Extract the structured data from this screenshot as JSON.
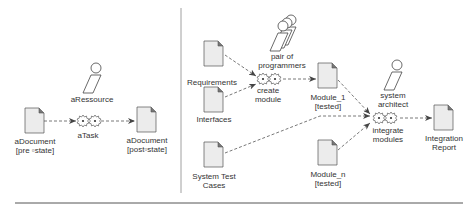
{
  "left_panel": {
    "pre_document": {
      "line1": "aDocument",
      "line2": "[pre ▫state]"
    },
    "task": {
      "label": "aTask"
    },
    "resource": {
      "label": "aRessource"
    },
    "post_document": {
      "line1": "aDocument",
      "line2": "[post▫state]"
    }
  },
  "right_panel": {
    "requirements": {
      "label": "Requirements"
    },
    "interfaces": {
      "label": "Interfaces"
    },
    "system_test_cases": {
      "line1": "System Test",
      "line2": "Cases"
    },
    "pair_of_programmers": {
      "line1": "pair of",
      "line2": "programmers"
    },
    "create_module": {
      "line1": "create",
      "line2": "module"
    },
    "module_1": {
      "line1": "Module_1",
      "line2": "[tested]"
    },
    "module_n": {
      "line1": "Module_n",
      "line2": "[tested]"
    },
    "system_architect": {
      "line1": "system",
      "line2": "architect"
    },
    "integrate_modules": {
      "line1": "integrate",
      "line2": "modules"
    },
    "integration_report": {
      "line1": "Integration",
      "line2": "Report"
    }
  },
  "colors": {
    "stroke": "#444444",
    "doc_fill": "#ececec",
    "text": "#333333",
    "divider": "#888888"
  }
}
